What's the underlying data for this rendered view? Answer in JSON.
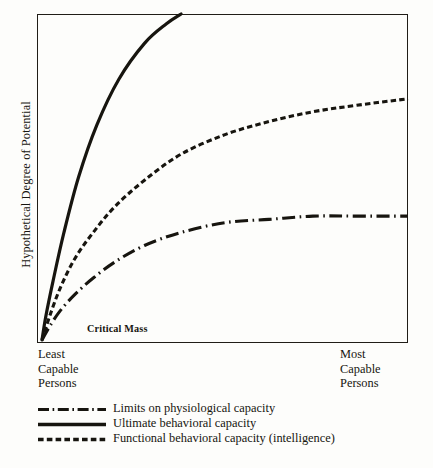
{
  "chart_data": {
    "type": "line",
    "title": "",
    "xlabel": "",
    "ylabel": "Hypothetical Degree of Potential",
    "x_axis_start_label": "Least\nCapable\nPersons",
    "x_axis_end_label": "Most\nCapable\nPersons",
    "x_start_label_lines": [
      "Least",
      "Capable",
      "Persons"
    ],
    "x_end_label_lines": [
      "Most",
      "Capable",
      "Persons"
    ],
    "grid": false,
    "legend_position": "below",
    "xlim": [
      0,
      100
    ],
    "ylim": [
      0,
      100
    ],
    "annotations": [
      {
        "text": "Critical Mass",
        "x": 14,
        "y": 6,
        "style": "bold"
      }
    ],
    "series": [
      {
        "name": "Limits on physiological capacity",
        "style": "dash-dot",
        "x": [
          0,
          2,
          5,
          9,
          14,
          20,
          28,
          38,
          50,
          62,
          74,
          86,
          100
        ],
        "values": [
          0,
          4,
          9,
          14,
          19,
          24,
          29,
          33,
          36,
          37,
          38,
          38,
          38
        ]
      },
      {
        "name": "Ultimate behavioral capacity",
        "style": "solid",
        "x": [
          0,
          1,
          3,
          6,
          10,
          15,
          21,
          28,
          34,
          38
        ],
        "values": [
          0,
          7,
          18,
          33,
          50,
          66,
          80,
          91,
          97,
          100
        ]
      },
      {
        "name": "Functional behavioral capacity (intelligence)",
        "style": "dashed",
        "x": [
          0,
          2,
          5,
          9,
          14,
          20,
          28,
          38,
          50,
          62,
          74,
          86,
          100
        ],
        "values": [
          0,
          7,
          16,
          25,
          33,
          41,
          49,
          57,
          63,
          67,
          70,
          72,
          74
        ]
      }
    ]
  },
  "legend": {
    "items": [
      {
        "label": "Limits on physiological capacity",
        "style": "dash-dot"
      },
      {
        "label": "Ultimate behavioral capacity",
        "style": "solid"
      },
      {
        "label": "Functional behavioral capacity  (intelligence)",
        "style": "dashed"
      }
    ]
  }
}
